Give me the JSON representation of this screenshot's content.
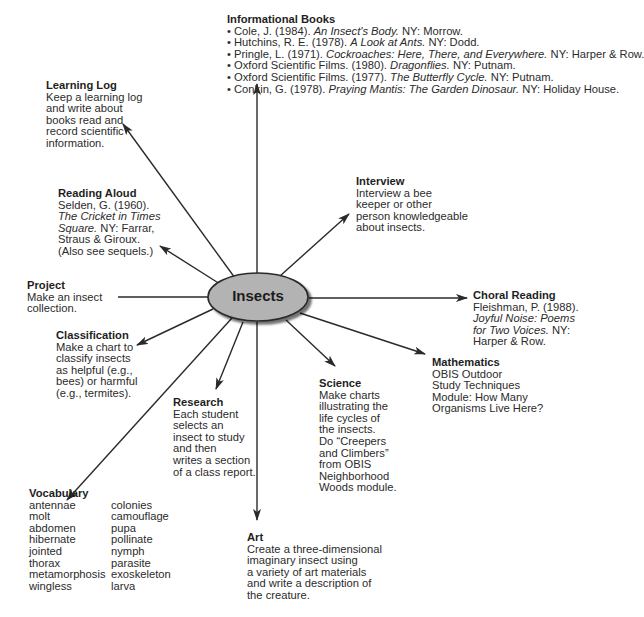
{
  "center": {
    "label": "Insects",
    "fill": "#b3b3b3",
    "stroke": "#2a2a2a"
  },
  "nodes": {
    "informational_books": {
      "title": "Informational Books",
      "items": [
        {
          "pre": "• Cole, J. (1984). ",
          "it": "An Insect's Body.",
          "post": " NY:  Morrow."
        },
        {
          "pre": "• Hutchins, R. E. (1978). ",
          "it": "A Look at Ants.",
          "post": " NY:  Dodd."
        },
        {
          "pre": "• Pringle, L. (1971). ",
          "it": "Cockroaches:  Here, There, and Everywhere.",
          "post": " NY:  Harper & Row."
        },
        {
          "pre": "• Oxford Scientific Films. (1980). ",
          "it": "Dragonflies.",
          "post": " NY:  Putnam."
        },
        {
          "pre": "• Oxford Scientific Films. (1977). ",
          "it": "The Butterfly Cycle.",
          "post": " NY:  Putnam."
        },
        {
          "pre": "• Conkin, G. (1978). ",
          "it": "Praying Mantis:  The Garden Dinosaur.",
          "post": " NY:  Holiday House."
        }
      ]
    },
    "learning_log": {
      "title": "Learning Log",
      "lines": [
        "Keep a learning log",
        "and write about",
        "books read and",
        "record scientific",
        "information."
      ]
    },
    "reading_aloud": {
      "title": "Reading Aloud",
      "line1": "Selden, G. (1960).",
      "line2_it": "The Cricket in Times",
      "line3_it": "Square.",
      "line3_post": " NY:  Farrar,",
      "line4": "Straus & Giroux.",
      "line5": "(Also see sequels.)"
    },
    "interview": {
      "title": "Interview",
      "lines": [
        "Interview a bee",
        "keeper or other",
        "person knowledgeable",
        "about insects."
      ]
    },
    "project": {
      "title": "Project",
      "lines": [
        "Make an insect",
        "collection."
      ]
    },
    "choral_reading": {
      "title": "Choral Reading",
      "line1": "Fleishman, P. (1988).",
      "line2_it": "Joyful Noise:  Poems",
      "line3_it": "for Two Voices.",
      "line3_post": "  NY:",
      "line4": "Harper & Row."
    },
    "classification": {
      "title": "Classification",
      "lines": [
        "Make a chart to",
        "classify insects",
        "as helpful (e.g.,",
        "bees) or harmful",
        "(e.g., termites)."
      ]
    },
    "mathematics": {
      "title": "Mathematics",
      "lines": [
        "OBIS Outdoor",
        "Study Techniques",
        "Module:  How Many",
        "Organisms Live Here?"
      ]
    },
    "science": {
      "title": "Science",
      "lines": [
        "Make charts",
        "illustrating the",
        "life cycles of",
        "the insects.",
        "Do “Creepers",
        "and Climbers”",
        "from OBIS",
        "Neighborhood",
        "Woods module."
      ]
    },
    "research": {
      "title": "Research",
      "lines": [
        "Each student",
        "selects an",
        "insect to study",
        "and then",
        "writes a section",
        "of a class report."
      ]
    },
    "vocabulary": {
      "title": "Vocabulary",
      "col1": [
        "antennae",
        "molt",
        "abdomen",
        "hibernate",
        "jointed",
        "thorax",
        "metamorphosis",
        "wingless"
      ],
      "col2": [
        "colonies",
        "camouflage",
        "pupa",
        "pollinate",
        "nymph",
        "parasite",
        "exoskeleton",
        "larva"
      ]
    },
    "art": {
      "title": "Art",
      "lines": [
        "Create a three-dimensional",
        "imaginary insect using",
        "a variety of art materials",
        "and write a description of",
        "the creature."
      ]
    }
  }
}
